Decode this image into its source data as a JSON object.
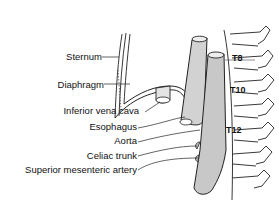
{
  "diagram": {
    "type": "anatomical illustration",
    "labels": {
      "sternum": "Sternum",
      "diaphragm": "Diaphragm",
      "ivc": "Inferior vena cava",
      "esophagus": "Esophagus",
      "aorta": "Aorta",
      "celiac": "Celiac trunk",
      "sma": "Superior mesenteric artery"
    },
    "vertebrae": {
      "t8": "T8",
      "t10": "T10",
      "t12": "T12"
    },
    "colors": {
      "line": "#222222",
      "vessel_fill": "#cfcfcf",
      "bone_fill": "#ffffff"
    }
  }
}
